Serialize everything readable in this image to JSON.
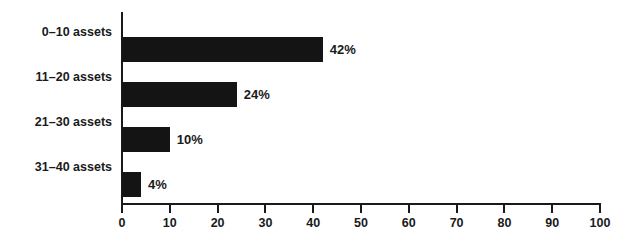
{
  "chart_data": {
    "type": "bar",
    "orientation": "horizontal",
    "title": "",
    "subtitle": "",
    "xlabel": "",
    "ylabel": "",
    "categories": [
      "0–10 assets",
      "11–20 assets",
      "21–30 assets",
      "31–40 assets"
    ],
    "values": [
      42,
      24,
      10,
      4
    ],
    "data_labels": [
      "42%",
      "24%",
      "10%",
      "4%"
    ],
    "xlim": [
      0,
      100
    ],
    "xticks": [
      0,
      10,
      20,
      30,
      40,
      50,
      60,
      70,
      80,
      90,
      100
    ],
    "xtick_labels": [
      "0",
      "10",
      "20",
      "30",
      "40",
      "50",
      "60",
      "70",
      "80",
      "90",
      "100"
    ],
    "grid": false,
    "legend": null,
    "bar_color": "#141414",
    "axis_color": "#1a1a1a",
    "text_color": "#1a1a1a",
    "background_color": "#ffffff"
  }
}
